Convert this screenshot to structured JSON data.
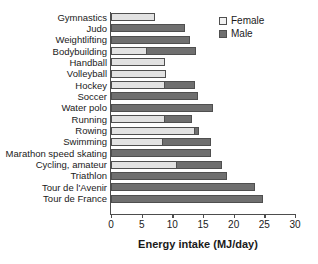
{
  "chart_data": {
    "type": "bar",
    "orientation": "horizontal",
    "stacked_overlay": true,
    "title": "",
    "subtitle": "",
    "xlabel": "Energy intake (MJ/day)",
    "ylabel": "",
    "xlim": [
      0,
      30
    ],
    "xticks": [
      0,
      5,
      10,
      15,
      20,
      25,
      30
    ],
    "xtick_labels": [
      "0",
      "5",
      "10",
      "15",
      "20",
      "25",
      "30"
    ],
    "grid": false,
    "legend_position": "top-right",
    "categories": [
      "Gymnastics",
      "Judo",
      "Weightlifting",
      "Bodybuilding",
      "Handball",
      "Volleyball",
      "Hockey",
      "Soccer",
      "Water polo",
      "Running",
      "Rowing",
      "Swimming",
      "Marathon speed skating",
      "Cycling, amateur",
      "Triathlon",
      "Tour de l'Avenir",
      "Tour de France"
    ],
    "series": [
      {
        "name": "Female",
        "color": "#e2e2e2",
        "values": [
          7.2,
          null,
          null,
          5.9,
          8.8,
          9.0,
          8.8,
          null,
          null,
          8.8,
          13.7,
          8.5,
          null,
          10.8,
          null,
          null,
          null
        ]
      },
      {
        "name": "Male",
        "color": "#6f6f6f",
        "values": [
          null,
          12.1,
          12.9,
          13.9,
          null,
          null,
          13.7,
          14.2,
          16.6,
          13.2,
          14.4,
          16.3,
          16.3,
          18.1,
          18.9,
          23.5,
          24.8
        ]
      }
    ]
  },
  "legend": {
    "items": [
      {
        "label": "Female",
        "swatch": "legend-swatch-female"
      },
      {
        "label": "Male",
        "swatch": "legend-swatch-male"
      }
    ]
  },
  "colors": {
    "female": "#e2e2e2",
    "male": "#6f6f6f",
    "axis": "#4d4d4d",
    "text": "#1a1a1a",
    "background": "#ffffff"
  }
}
